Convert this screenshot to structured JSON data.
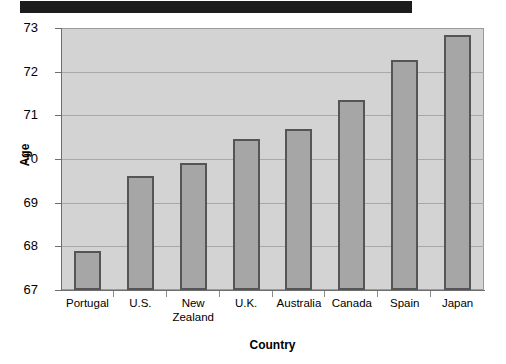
{
  "banner": {
    "name": "black-banner"
  },
  "chart_data": {
    "type": "bar",
    "title": "",
    "xlabel": "Country",
    "ylabel": "Age",
    "categories": [
      "Portugal",
      "U.S.",
      "New\nZealand",
      "U.K.",
      "Australia",
      "Canada",
      "Spain",
      "Japan"
    ],
    "values": [
      67.9,
      69.6,
      69.9,
      70.45,
      70.68,
      71.35,
      72.27,
      72.85
    ],
    "ylim": [
      67,
      73
    ],
    "yticks": [
      67,
      68,
      69,
      70,
      71,
      72,
      73
    ],
    "ytick_labels": [
      "67",
      "68",
      "69",
      "70",
      "71",
      "72",
      "73"
    ],
    "grid": true,
    "legend": "none",
    "bar_fill": "#a6a6a6",
    "bar_border": "#555555",
    "plot_background": "#d3d3d3"
  }
}
